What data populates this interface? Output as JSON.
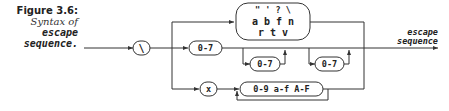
{
  "caption": {
    "title": "Figure 3.6:",
    "subtitle": "Syntax of",
    "term_line1": "escape",
    "term_line2": "sequence."
  },
  "diagram": {
    "start_symbol": "\\",
    "simple_escape_box": {
      "row1": "\" ' ? \\",
      "row2": "a b f n",
      "row3": "r t v"
    },
    "octal_digit_1": "0-7",
    "octal_digit_2": "0-7",
    "octal_digit_3": "0-7",
    "hex_prefix": "x",
    "hex_digit": "0-9 a-f A-F",
    "output_label_line1": "escape",
    "output_label_line2": "sequence"
  }
}
